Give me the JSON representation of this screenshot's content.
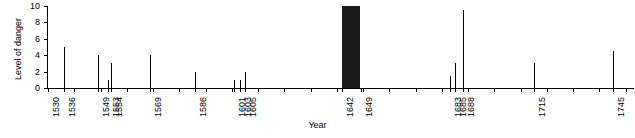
{
  "chart_data": {
    "type": "bar",
    "title": "",
    "xlabel": "Year",
    "ylabel": "Level of danger",
    "xlim": [
      1530,
      1752
    ],
    "ylim": [
      0,
      10
    ],
    "yticks": [
      0,
      2,
      4,
      6,
      8,
      10
    ],
    "ytick_labels": [
      "0",
      "2",
      "4",
      "6",
      "8",
      "10"
    ],
    "grid": false,
    "legend": false,
    "xtick_labels": [
      "1530",
      "1536",
      "1549",
      "1553",
      "1554",
      "1569",
      "1586",
      "1601",
      "1603",
      "1605",
      "1642",
      "1649",
      "1683",
      "1685",
      "1688",
      "1715",
      "1745"
    ],
    "xticks": [
      1530,
      1536,
      1549,
      1553,
      1554,
      1569,
      1586,
      1601,
      1603,
      1605,
      1642,
      1649,
      1683,
      1685,
      1688,
      1715,
      1745
    ],
    "minor_xticks": [
      1540,
      1550,
      1560,
      1570,
      1580,
      1590,
      1600,
      1610,
      1620,
      1630,
      1640,
      1650,
      1660,
      1670,
      1680,
      1690,
      1700,
      1710,
      1720,
      1730,
      1740,
      1750
    ],
    "x": [
      1536,
      1549,
      1553,
      1554,
      1569,
      1586,
      1601,
      1603,
      1605,
      1683,
      1685,
      1688,
      1715,
      1745
    ],
    "values": [
      5,
      4,
      1,
      3,
      4,
      2,
      1,
      1,
      2,
      1.5,
      3,
      9.5,
      3,
      4.5
    ],
    "blocks": [
      {
        "x_start": 1642,
        "x_end": 1649,
        "value": 10,
        "color": "#1a1a1a"
      }
    ],
    "colors": {
      "bar": "#000000",
      "block": "#1a1a1a",
      "axis": "#000000"
    }
  }
}
